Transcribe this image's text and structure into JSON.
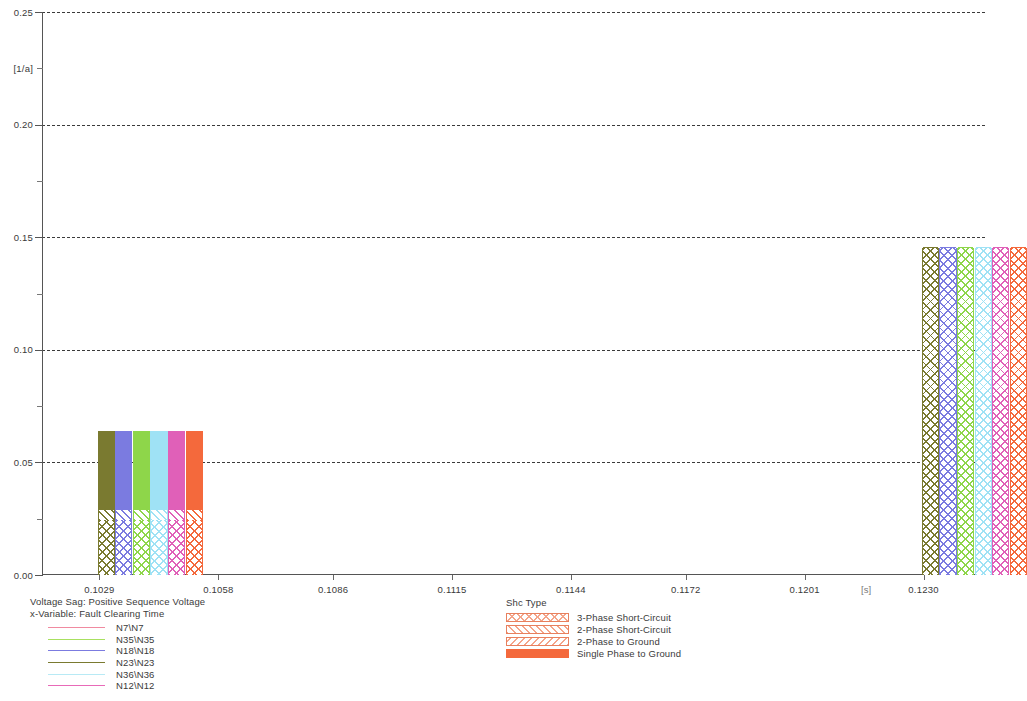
{
  "chart_data": {
    "type": "bar",
    "title": "Voltage Sag: Positive Sequence Voltage",
    "subtitle": "x-Variable: Fault Clearing Time",
    "xlabel": "Fault Clearing Time",
    "ylabel": "",
    "y_unit": "[1/a]",
    "x_unit": "[s]",
    "grid": true,
    "stacked": true,
    "legend_position": "bottom",
    "ylim": [
      0.0,
      0.25
    ],
    "ytick_labels": [
      "0.00",
      "0.05",
      "0.10",
      "0.15",
      "0.20",
      "0.25"
    ],
    "ytick_values": [
      0.0,
      0.05,
      0.1,
      0.15,
      0.2,
      0.25
    ],
    "xtick_labels": [
      "0.1029",
      "0.1058",
      "0.1086",
      "0.1115",
      "0.1144",
      "0.1172",
      "0.1201",
      "0.1230"
    ],
    "xtick_values": [
      0.1029,
      0.1058,
      0.1086,
      0.1115,
      0.1144,
      0.1172,
      0.1201,
      0.123
    ],
    "xlim": [
      0.1015,
      0.1245
    ],
    "series": [
      {
        "name": "N7\\N7",
        "color": "#f08aa0"
      },
      {
        "name": "N35\\N35",
        "color": "#a8e060"
      },
      {
        "name": "N18\\N18",
        "color": "#7b7be0"
      },
      {
        "name": "N23\\N23",
        "color": "#7a7a30"
      },
      {
        "name": "N36\\N36",
        "color": "#b8eaf5"
      },
      {
        "name": "N12\\N12",
        "color": "#e86ab8"
      }
    ],
    "stack_categories": [
      {
        "name": "3-Phase Short-Circuit",
        "pattern": "cross-hatch",
        "color": "#f4a58a"
      },
      {
        "name": "2-Phase Short-Circuit",
        "pattern": "diagonal-hatch",
        "color": "#f4a58a"
      },
      {
        "name": "2-Phase to Ground",
        "pattern": "back-hatch",
        "color": "#f4a58a"
      },
      {
        "name": "Single Phase to Ground",
        "pattern": "solid",
        "color": "#f4693c"
      }
    ],
    "groups": [
      {
        "x_label": "0.1029",
        "x_value": 0.1029,
        "bars": [
          {
            "series": "N23\\N23",
            "color": "#7a7a30",
            "total": 0.064,
            "segments": [
              {
                "cat": "3-Phase Short-Circuit",
                "value": 0.0245
              },
              {
                "cat": "2-Phase Short-Circuit",
                "value": 0.0045
              },
              {
                "cat": "Single Phase to Ground",
                "value": 0.035
              }
            ]
          },
          {
            "series": "N18\\N18",
            "color": "#7b7be0",
            "total": 0.064,
            "segments": [
              {
                "cat": "3-Phase Short-Circuit",
                "value": 0.0245
              },
              {
                "cat": "2-Phase Short-Circuit",
                "value": 0.0045
              },
              {
                "cat": "Single Phase to Ground",
                "value": 0.035
              }
            ]
          },
          {
            "series": "N35\\N35",
            "color": "#8ed64a",
            "total": 0.064,
            "segments": [
              {
                "cat": "3-Phase Short-Circuit",
                "value": 0.0245
              },
              {
                "cat": "2-Phase Short-Circuit",
                "value": 0.0045
              },
              {
                "cat": "Single Phase to Ground",
                "value": 0.035
              }
            ]
          },
          {
            "series": "N36\\N36",
            "color": "#9fe2f5",
            "total": 0.064,
            "segments": [
              {
                "cat": "3-Phase Short-Circuit",
                "value": 0.0245
              },
              {
                "cat": "2-Phase Short-Circuit",
                "value": 0.0045
              },
              {
                "cat": "Single Phase to Ground",
                "value": 0.035
              }
            ]
          },
          {
            "series": "N12\\N12",
            "color": "#e060b8",
            "total": 0.064,
            "segments": [
              {
                "cat": "3-Phase Short-Circuit",
                "value": 0.0245
              },
              {
                "cat": "2-Phase Short-Circuit",
                "value": 0.0045
              },
              {
                "cat": "Single Phase to Ground",
                "value": 0.035
              }
            ]
          },
          {
            "series": "N7\\N7",
            "color": "#f4693c",
            "total": 0.064,
            "segments": [
              {
                "cat": "3-Phase Short-Circuit",
                "value": 0.0245
              },
              {
                "cat": "2-Phase Short-Circuit",
                "value": 0.0045
              },
              {
                "cat": "Single Phase to Ground",
                "value": 0.035
              }
            ]
          }
        ]
      },
      {
        "x_label": "0.1230",
        "x_value": 0.123,
        "bars": [
          {
            "series": "N23\\N23",
            "color": "#7a7a30",
            "total": 0.145,
            "segments": [
              {
                "cat": "3-Phase Short-Circuit",
                "value": 0.145
              }
            ]
          },
          {
            "series": "N18\\N18",
            "color": "#7b7be0",
            "total": 0.145,
            "segments": [
              {
                "cat": "3-Phase Short-Circuit",
                "value": 0.145
              }
            ]
          },
          {
            "series": "N35\\N35",
            "color": "#8ed64a",
            "total": 0.145,
            "segments": [
              {
                "cat": "3-Phase Short-Circuit",
                "value": 0.145
              }
            ]
          },
          {
            "series": "N36\\N36",
            "color": "#9fe2f5",
            "total": 0.145,
            "segments": [
              {
                "cat": "3-Phase Short-Circuit",
                "value": 0.145
              }
            ]
          },
          {
            "series": "N12\\N12",
            "color": "#e060b8",
            "total": 0.145,
            "segments": [
              {
                "cat": "3-Phase Short-Circuit",
                "value": 0.145
              }
            ]
          },
          {
            "series": "N7\\N7",
            "color": "#f4693c",
            "total": 0.145,
            "segments": [
              {
                "cat": "3-Phase Short-Circuit",
                "value": 0.145
              }
            ]
          }
        ]
      }
    ]
  },
  "caption": {
    "line1": "Voltage Sag: Positive Sequence Voltage",
    "line2": "x-Variable:  Fault Clearing Time"
  },
  "shc_legend": {
    "title": "Shc Type"
  },
  "axis": {
    "y_unit": "[1/a]",
    "x_unit": "[s]"
  }
}
